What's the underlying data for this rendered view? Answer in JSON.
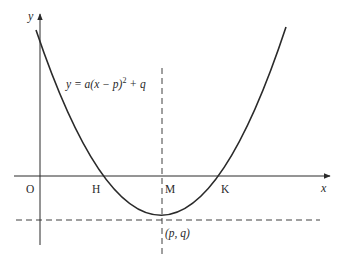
{
  "diagram": {
    "equation": "y = a(x − p)² + q",
    "equation_parts": {
      "lhs": "y = a(x − p)",
      "exp": "2",
      "rhs": " + q"
    },
    "axes": {
      "x_label": "x",
      "y_label": "y"
    },
    "points": {
      "origin": "O",
      "left_root": "H",
      "axis_foot": "M",
      "right_root": "K",
      "vertex": "(p, q)"
    },
    "colors": {
      "stroke": "#2a2a2a",
      "background": "#ffffff"
    }
  }
}
